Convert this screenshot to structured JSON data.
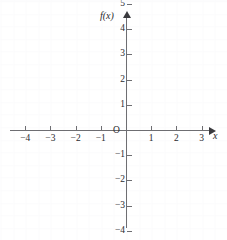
{
  "chart_data": {
    "type": "scatter",
    "title": "",
    "subtitle": "",
    "xlabel": "x",
    "ylabel": "f(x)",
    "origin_label": "O",
    "xlim": [
      -4.6,
      3.4
    ],
    "ylim": [
      -7.6,
      7.4
    ],
    "grid": true,
    "legend": null,
    "series": [],
    "x_ticks": [
      {
        "value": -4,
        "label": "−4"
      },
      {
        "value": -3,
        "label": "−3"
      },
      {
        "value": -2,
        "label": "−2"
      },
      {
        "value": -1,
        "label": "−1"
      },
      {
        "value": 1,
        "label": "1"
      },
      {
        "value": 2,
        "label": "2"
      },
      {
        "value": 3,
        "label": "3"
      }
    ],
    "y_ticks": [
      {
        "value": 7,
        "label": "7"
      },
      {
        "value": 6,
        "label": "6"
      },
      {
        "value": 5,
        "label": "5"
      },
      {
        "value": 4,
        "label": "4"
      },
      {
        "value": 3,
        "label": "3"
      },
      {
        "value": 2,
        "label": "2"
      },
      {
        "value": 1,
        "label": "1"
      },
      {
        "value": -1,
        "label": "−1"
      },
      {
        "value": -2,
        "label": "−2"
      },
      {
        "value": -3,
        "label": "−3"
      },
      {
        "value": -4,
        "label": "−4"
      },
      {
        "value": -5,
        "label": "−5"
      },
      {
        "value": -6,
        "label": "−6"
      },
      {
        "value": -7,
        "label": "−7"
      }
    ],
    "colors": {
      "axis": "#6e6e72",
      "text": "#2b2b2e",
      "grid": "#fbfbfc",
      "background": "#ffffff",
      "arrow": "#3a3a3e"
    },
    "geometry": {
      "origin_px": {
        "x": 126,
        "y": 130
      },
      "unit_px": 25.2
    }
  }
}
